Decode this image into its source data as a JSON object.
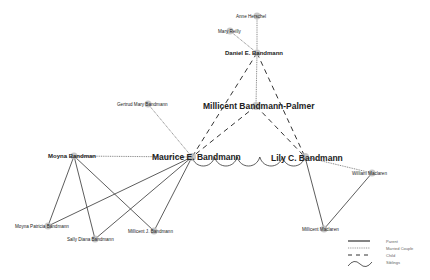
{
  "diagram": {
    "nodes": [
      {
        "id": "anne",
        "label": "Anne Herschel",
        "x": 257,
        "y": 16,
        "size": "sm",
        "lx": 236,
        "ly": 18
      },
      {
        "id": "mary",
        "label": "Mary Reilly",
        "x": 230,
        "y": 31,
        "size": "sm",
        "lx": 218,
        "ly": 33
      },
      {
        "id": "daniel",
        "label": "Daniel E. Bandmann",
        "x": 257,
        "y": 53,
        "size": "med",
        "lx": 225,
        "ly": 55
      },
      {
        "id": "gertrud",
        "label": "Gertrud Mary Bandmann",
        "x": 148,
        "y": 104,
        "size": "sm",
        "lx": 117,
        "ly": 106
      },
      {
        "id": "millicentbp",
        "label": "Millicent Bandmann-Palmer",
        "x": 256,
        "y": 106,
        "size": "big",
        "lx": 203,
        "ly": 109
      },
      {
        "id": "maurice",
        "label": "Maurice E. Bandmann",
        "x": 192,
        "y": 157,
        "size": "big",
        "lx": 152,
        "ly": 160
      },
      {
        "id": "lily",
        "label": "Lily C. Bandmann",
        "x": 305,
        "y": 157,
        "size": "big",
        "lx": 271,
        "ly": 161
      },
      {
        "id": "moyna",
        "label": "Moyna Bandman",
        "x": 74,
        "y": 156,
        "size": "med",
        "lx": 48,
        "ly": 158
      },
      {
        "id": "william",
        "label": "William Maclaren",
        "x": 372,
        "y": 173,
        "size": "sm",
        "lx": 352,
        "ly": 175
      },
      {
        "id": "moynap",
        "label": "Moyna Patricia Bandmann",
        "x": 48,
        "y": 226,
        "size": "sm",
        "lx": 15,
        "ly": 228
      },
      {
        "id": "sally",
        "label": "Sally Diana Bandmann",
        "x": 95,
        "y": 239,
        "size": "sm",
        "lx": 67,
        "ly": 241
      },
      {
        "id": "millicentj",
        "label": "Millicent J. Bandmann",
        "x": 154,
        "y": 231,
        "size": "sm",
        "lx": 128,
        "ly": 233
      },
      {
        "id": "millicentm",
        "label": "Millicent Maclaren",
        "x": 324,
        "y": 229,
        "size": "sm",
        "lx": 302,
        "ly": 231
      }
    ],
    "edges": [
      {
        "from": "anne",
        "to": "daniel",
        "type": "married"
      },
      {
        "from": "mary",
        "to": "daniel",
        "type": "married"
      },
      {
        "from": "daniel",
        "to": "millicentbp",
        "type": "married"
      },
      {
        "from": "daniel",
        "to": "maurice",
        "type": "child"
      },
      {
        "from": "daniel",
        "to": "lily",
        "type": "child"
      },
      {
        "from": "millicentbp",
        "to": "maurice",
        "type": "child"
      },
      {
        "from": "millicentbp",
        "to": "lily",
        "type": "child"
      },
      {
        "from": "gertrud",
        "to": "maurice",
        "type": "married"
      },
      {
        "from": "moyna",
        "to": "maurice",
        "type": "married"
      },
      {
        "from": "lily",
        "to": "william",
        "type": "married"
      },
      {
        "from": "moyna",
        "to": "moynap",
        "type": "parent"
      },
      {
        "from": "moyna",
        "to": "sally",
        "type": "parent"
      },
      {
        "from": "moyna",
        "to": "millicentj",
        "type": "parent"
      },
      {
        "from": "maurice",
        "to": "moynap",
        "type": "parent"
      },
      {
        "from": "maurice",
        "to": "sally",
        "type": "parent"
      },
      {
        "from": "maurice",
        "to": "millicentj",
        "type": "parent"
      },
      {
        "from": "lily",
        "to": "millicentm",
        "type": "parent"
      },
      {
        "from": "william",
        "to": "millicentm",
        "type": "parent"
      },
      {
        "from": "maurice",
        "to": "lily",
        "type": "siblings"
      }
    ]
  },
  "legend": {
    "items": [
      {
        "type": "parent",
        "label": "Parent"
      },
      {
        "type": "married",
        "label": "Married Couple"
      },
      {
        "type": "child",
        "label": "Child"
      },
      {
        "type": "siblings",
        "label": "Siblings"
      }
    ]
  },
  "colors": {
    "line": "#333333",
    "node": "#bdbdbd",
    "text": "#222222",
    "legend": "#666666"
  }
}
